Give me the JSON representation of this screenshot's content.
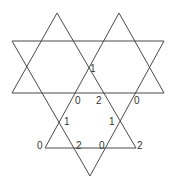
{
  "diagram": {
    "line_color": "#4a4a4a",
    "label_color": "#333333",
    "lines": [
      {
        "id": "upper-left-apex-left",
        "x1": 57,
        "y1": 13,
        "x2": 12,
        "y2": 93
      },
      {
        "id": "upper-left-apex-right",
        "x1": 57,
        "y1": 13,
        "x2": 136,
        "y2": 148
      },
      {
        "id": "upper-right-apex-right",
        "x1": 119,
        "y1": 13,
        "x2": 164,
        "y2": 93
      },
      {
        "id": "upper-right-apex-left",
        "x1": 119,
        "y1": 13,
        "x2": 45,
        "y2": 148
      },
      {
        "id": "top-horizontal",
        "x1": 12,
        "y1": 41,
        "x2": 164,
        "y2": 41
      },
      {
        "id": "middle-horizontal",
        "x1": 12,
        "y1": 93,
        "x2": 164,
        "y2": 93
      },
      {
        "id": "bottom-horizontal",
        "x1": 45,
        "y1": 148,
        "x2": 136,
        "y2": 148
      },
      {
        "id": "down-left-edge",
        "x1": 12,
        "y1": 41,
        "x2": 90,
        "y2": 176
      },
      {
        "id": "down-right-edge",
        "x1": 164,
        "y1": 41,
        "x2": 90,
        "y2": 176
      }
    ],
    "labels": [
      {
        "text": "1",
        "x": 90,
        "y": 72
      },
      {
        "text": "0",
        "x": 75,
        "y": 104
      },
      {
        "text": "2",
        "x": 96,
        "y": 104
      },
      {
        "text": "0",
        "x": 134,
        "y": 104
      },
      {
        "text": "1",
        "x": 64,
        "y": 125
      },
      {
        "text": "1",
        "x": 109,
        "y": 125
      },
      {
        "text": "0",
        "x": 37,
        "y": 149
      },
      {
        "text": "2",
        "x": 76,
        "y": 149
      },
      {
        "text": "0",
        "x": 99,
        "y": 149
      },
      {
        "text": "2",
        "x": 137,
        "y": 149
      }
    ]
  }
}
